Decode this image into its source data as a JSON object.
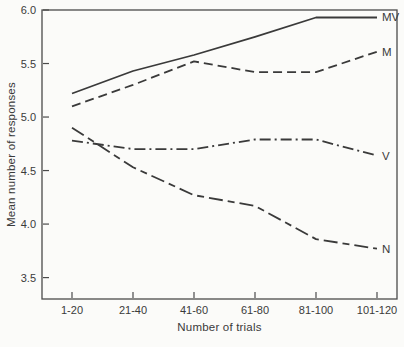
{
  "chart_data": {
    "type": "line",
    "title": "",
    "xlabel": "Number of trials",
    "ylabel": "Mean number of responses",
    "categories": [
      "1-20",
      "21-40",
      "41-60",
      "61-80",
      "81-100",
      "101-120"
    ],
    "y_ticks": [
      6.0,
      5.5,
      5.0,
      4.5,
      4.0,
      3.5
    ],
    "ylim": [
      3.3,
      6.0
    ],
    "grid": false,
    "legend_position": "line-end-labels",
    "line_color": "#3a3a3a",
    "axis_color": "#4a4a4a",
    "series": [
      {
        "name": "MV",
        "style": "solid",
        "values": [
          5.22,
          5.43,
          5.58,
          5.75,
          5.93,
          5.93
        ]
      },
      {
        "name": "M",
        "style": "dashed",
        "values": [
          5.1,
          5.3,
          5.52,
          5.42,
          5.42,
          5.61
        ]
      },
      {
        "name": "V",
        "style": "dashdot",
        "values": [
          4.78,
          4.7,
          4.7,
          4.79,
          4.79,
          4.64
        ]
      },
      {
        "name": "N",
        "style": "longdash",
        "values": [
          4.9,
          4.53,
          4.27,
          4.17,
          3.86,
          3.77
        ]
      }
    ]
  }
}
